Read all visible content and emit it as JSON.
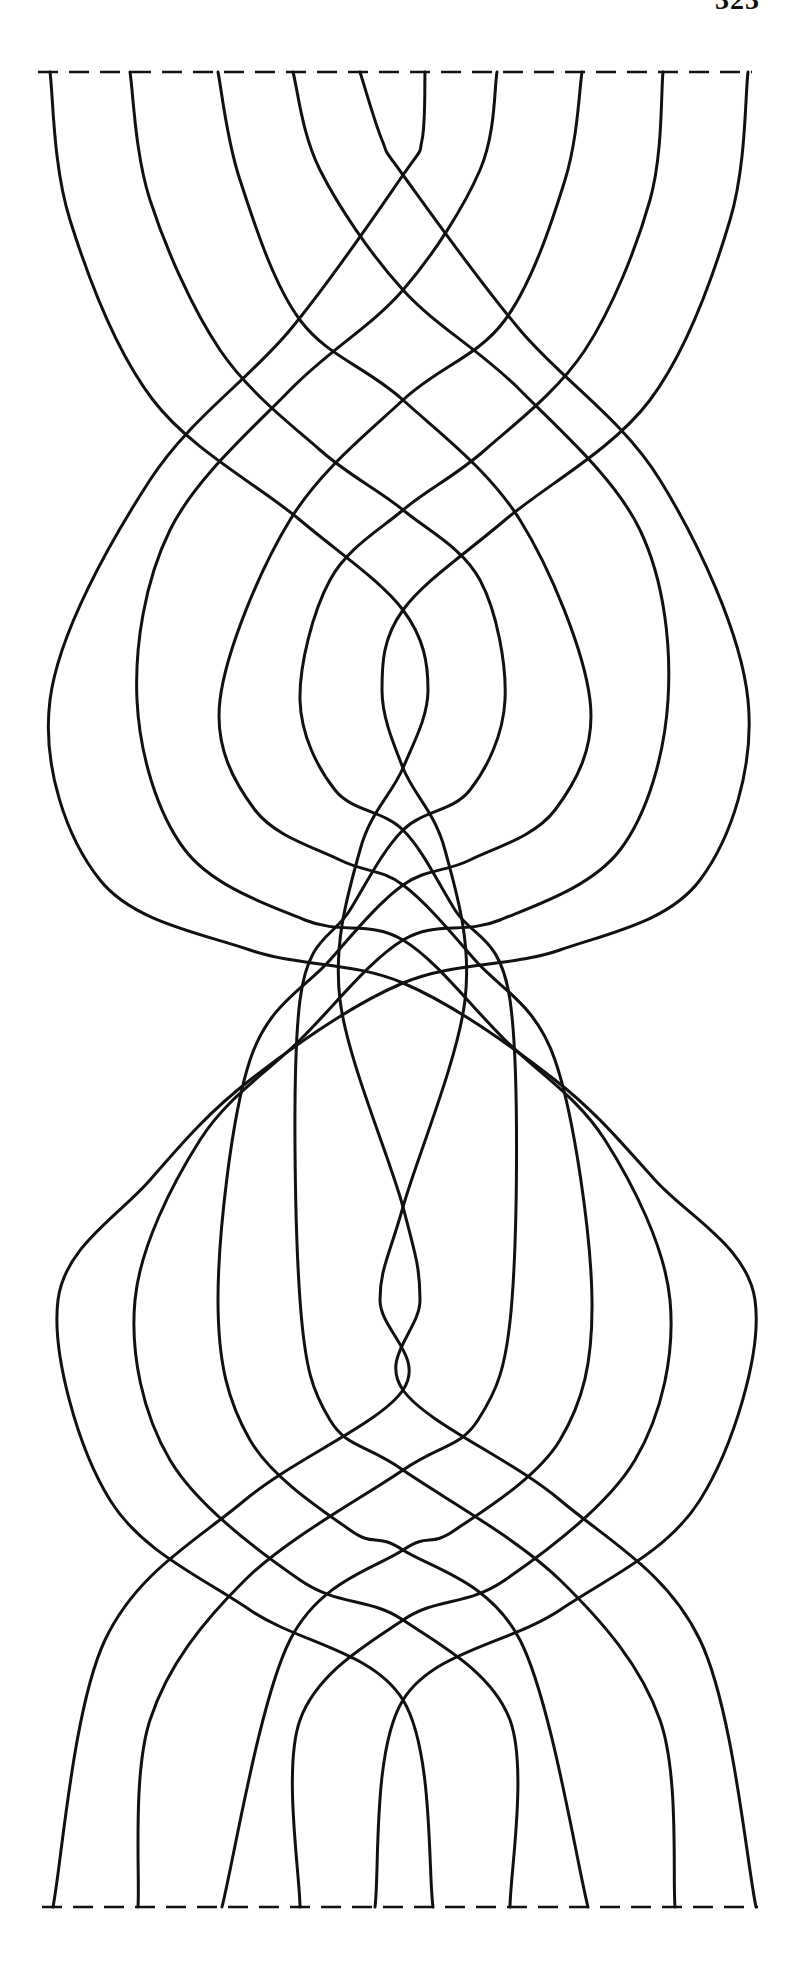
{
  "page": {
    "number": "323"
  },
  "figure": {
    "type": "woven-strand-diagram",
    "stroke_color": "#111111",
    "background": "#ffffff",
    "center_x": 403,
    "top_edge": {
      "y": 72,
      "x_start": 38,
      "x_end": 752,
      "style": "dashed"
    },
    "bottom_edge": {
      "y": 1907,
      "x_start": 42,
      "x_end": 758,
      "style": "dashed"
    },
    "strand_count": 10,
    "strands": [
      {
        "id": "L0",
        "points": [
          [
            360,
            72
          ],
          [
            382,
            140
          ],
          [
            403,
            175
          ],
          [
            520,
            330
          ],
          [
            660,
            480
          ],
          [
            748,
            700
          ],
          [
            700,
            880
          ],
          [
            560,
            950
          ],
          [
            403,
            983
          ],
          [
            250,
            1080
          ],
          [
            150,
            1180
          ],
          [
            58,
            1300
          ],
          [
            110,
            1500
          ],
          [
            250,
            1610
          ],
          [
            403,
            1700
          ],
          [
            433,
            1907
          ]
        ]
      },
      {
        "id": "L1",
        "points": [
          [
            293,
            72
          ],
          [
            320,
            170
          ],
          [
            403,
            290
          ],
          [
            520,
            390
          ],
          [
            640,
            530
          ],
          [
            668,
            700
          ],
          [
            620,
            850
          ],
          [
            500,
            920
          ],
          [
            403,
            940
          ],
          [
            300,
            1040
          ],
          [
            200,
            1140
          ],
          [
            135,
            1300
          ],
          [
            170,
            1460
          ],
          [
            300,
            1580
          ],
          [
            403,
            1620
          ],
          [
            510,
            1720
          ],
          [
            510,
            1907
          ]
        ]
      },
      {
        "id": "L2",
        "points": [
          [
            218,
            72
          ],
          [
            240,
            180
          ],
          [
            300,
            320
          ],
          [
            403,
            400
          ],
          [
            520,
            520
          ],
          [
            590,
            700
          ],
          [
            555,
            810
          ],
          [
            470,
            860
          ],
          [
            403,
            885
          ],
          [
            330,
            960
          ],
          [
            250,
            1060
          ],
          [
            218,
            1300
          ],
          [
            250,
            1440
          ],
          [
            350,
            1530
          ],
          [
            403,
            1550
          ],
          [
            520,
            1640
          ],
          [
            588,
            1907
          ]
        ]
      },
      {
        "id": "L3",
        "points": [
          [
            130,
            72
          ],
          [
            150,
            200
          ],
          [
            220,
            350
          ],
          [
            320,
            450
          ],
          [
            403,
            510
          ],
          [
            480,
            580
          ],
          [
            505,
            700
          ],
          [
            470,
            790
          ],
          [
            403,
            830
          ],
          [
            350,
            910
          ],
          [
            300,
            1000
          ],
          [
            300,
            1300
          ],
          [
            330,
            1420
          ],
          [
            403,
            1470
          ],
          [
            560,
            1580
          ],
          [
            660,
            1720
          ],
          [
            675,
            1907
          ]
        ]
      },
      {
        "id": "L4",
        "points": [
          [
            50,
            72
          ],
          [
            70,
            220
          ],
          [
            153,
            400
          ],
          [
            300,
            520
          ],
          [
            403,
            610
          ],
          [
            428,
            690
          ],
          [
            403,
            768
          ],
          [
            360,
            850
          ],
          [
            340,
            1000
          ],
          [
            403,
            1207
          ],
          [
            420,
            1300
          ],
          [
            403,
            1390
          ],
          [
            560,
            1500
          ],
          [
            700,
            1640
          ],
          [
            756,
            1907
          ]
        ]
      },
      {
        "id": "R0",
        "points": [
          [
            425,
            72
          ],
          [
            422,
            140
          ],
          [
            403,
            175
          ],
          [
            290,
            330
          ],
          [
            150,
            480
          ],
          [
            50,
            700
          ],
          [
            100,
            880
          ],
          [
            250,
            950
          ],
          [
            403,
            983
          ],
          [
            555,
            1080
          ],
          [
            655,
            1180
          ],
          [
            755,
            1300
          ],
          [
            700,
            1500
          ],
          [
            560,
            1610
          ],
          [
            403,
            1700
          ],
          [
            375,
            1907
          ]
        ]
      },
      {
        "id": "R1",
        "points": [
          [
            497,
            72
          ],
          [
            480,
            170
          ],
          [
            403,
            290
          ],
          [
            290,
            390
          ],
          [
            170,
            530
          ],
          [
            137,
            700
          ],
          [
            185,
            850
          ],
          [
            305,
            920
          ],
          [
            403,
            940
          ],
          [
            505,
            1040
          ],
          [
            605,
            1140
          ],
          [
            670,
            1300
          ],
          [
            635,
            1460
          ],
          [
            505,
            1580
          ],
          [
            403,
            1620
          ],
          [
            300,
            1720
          ],
          [
            300,
            1907
          ]
        ]
      },
      {
        "id": "R2",
        "points": [
          [
            582,
            72
          ],
          [
            565,
            180
          ],
          [
            505,
            320
          ],
          [
            403,
            400
          ],
          [
            290,
            520
          ],
          [
            220,
            700
          ],
          [
            255,
            810
          ],
          [
            340,
            860
          ],
          [
            403,
            885
          ],
          [
            475,
            960
          ],
          [
            555,
            1060
          ],
          [
            592,
            1300
          ],
          [
            560,
            1440
          ],
          [
            455,
            1530
          ],
          [
            403,
            1550
          ],
          [
            290,
            1640
          ],
          [
            222,
            1907
          ]
        ]
      },
      {
        "id": "R3",
        "points": [
          [
            663,
            72
          ],
          [
            650,
            200
          ],
          [
            585,
            350
          ],
          [
            485,
            450
          ],
          [
            403,
            510
          ],
          [
            330,
            580
          ],
          [
            300,
            700
          ],
          [
            335,
            790
          ],
          [
            403,
            830
          ],
          [
            455,
            910
          ],
          [
            510,
            1000
          ],
          [
            512,
            1300
          ],
          [
            478,
            1420
          ],
          [
            403,
            1470
          ],
          [
            245,
            1580
          ],
          [
            150,
            1720
          ],
          [
            138,
            1907
          ]
        ]
      },
      {
        "id": "R4",
        "points": [
          [
            748,
            72
          ],
          [
            730,
            220
          ],
          [
            650,
            400
          ],
          [
            505,
            520
          ],
          [
            403,
            610
          ],
          [
            382,
            690
          ],
          [
            403,
            768
          ],
          [
            445,
            850
          ],
          [
            465,
            1000
          ],
          [
            403,
            1207
          ],
          [
            380,
            1300
          ],
          [
            403,
            1390
          ],
          [
            245,
            1500
          ],
          [
            105,
            1640
          ],
          [
            53,
            1907
          ]
        ]
      }
    ]
  }
}
